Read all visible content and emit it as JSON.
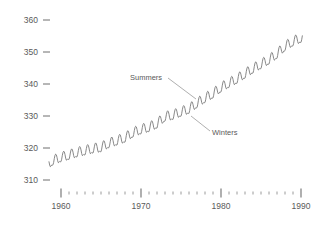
{
  "chart_data": {
    "type": "line",
    "title": "",
    "subtitle": "",
    "xlabel": "",
    "ylabel": "",
    "xlim": [
      1958.2,
      1990.4
    ],
    "ylim": [
      307.5,
      362
    ],
    "grid": false,
    "legend_position": "none",
    "x_ticks_major": [
      1960,
      1970,
      1980,
      1990
    ],
    "x_ticks_major_labels": [
      "1960",
      "1970",
      "1980",
      "1990"
    ],
    "x_ticks_minor": [
      1961,
      1962,
      1963,
      1964,
      1965,
      1966,
      1967,
      1968,
      1969,
      1971,
      1972,
      1973,
      1974,
      1975,
      1976,
      1977,
      1978,
      1979,
      1981,
      1982,
      1983,
      1984,
      1985,
      1986,
      1987,
      1988,
      1989
    ],
    "y_ticks": [
      310,
      320,
      330,
      340,
      350,
      360
    ],
    "y_tick_labels": [
      "310",
      "320",
      "330",
      "340",
      "350",
      "360"
    ],
    "line_color": "#7a7a7a",
    "text_color": "#5a5a5a",
    "axis_color": "#6e6e6e",
    "annotations": [
      {
        "label": "Summers",
        "text_x": 130,
        "text_y": 80,
        "leader_from_x": 168,
        "leader_from_y": 78,
        "leader_to_x": 196,
        "leader_to_y": 99
      },
      {
        "label": "Winters",
        "text_x": 212,
        "text_y": 135,
        "leader_from_x": 210,
        "leader_from_y": 131,
        "leader_to_x": 191,
        "leader_to_y": 116
      }
    ],
    "series": [
      {
        "name": "Atmospheric CO2 (ppm), Mauna Loa monthly mean",
        "annual_trend": [
          {
            "year": 1958.5,
            "value": 315.0
          },
          {
            "year": 1959,
            "value": 315.9
          },
          {
            "year": 1960,
            "value": 316.9
          },
          {
            "year": 1961,
            "value": 317.6
          },
          {
            "year": 1962,
            "value": 318.4
          },
          {
            "year": 1963,
            "value": 319.0
          },
          {
            "year": 1964,
            "value": 319.6
          },
          {
            "year": 1965,
            "value": 320.0
          },
          {
            "year": 1966,
            "value": 321.3
          },
          {
            "year": 1967,
            "value": 322.1
          },
          {
            "year": 1968,
            "value": 323.0
          },
          {
            "year": 1969,
            "value": 324.6
          },
          {
            "year": 1970,
            "value": 325.6
          },
          {
            "year": 1971,
            "value": 326.3
          },
          {
            "year": 1972,
            "value": 327.4
          },
          {
            "year": 1973,
            "value": 329.6
          },
          {
            "year": 1974,
            "value": 330.1
          },
          {
            "year": 1975,
            "value": 331.1
          },
          {
            "year": 1976,
            "value": 332.0
          },
          {
            "year": 1977,
            "value": 333.8
          },
          {
            "year": 1978,
            "value": 335.4
          },
          {
            "year": 1979,
            "value": 336.8
          },
          {
            "year": 1980,
            "value": 338.7
          },
          {
            "year": 1981,
            "value": 340.1
          },
          {
            "year": 1982,
            "value": 341.4
          },
          {
            "year": 1983,
            "value": 343.0
          },
          {
            "year": 1984,
            "value": 344.6
          },
          {
            "year": 1985,
            "value": 346.0
          },
          {
            "year": 1986,
            "value": 347.4
          },
          {
            "year": 1987,
            "value": 349.2
          },
          {
            "year": 1988,
            "value": 351.6
          },
          {
            "year": 1989,
            "value": 353.1
          },
          {
            "year": 1990.2,
            "value": 354.4
          }
        ],
        "seasonal_amplitude": 3.1,
        "seasonal_peak_month": 5,
        "description": "Monthly mean CO2 with a rising trend and a regular annual sawtooth: maxima in late spring (Summers label points to peaks), minima in autumn/winter (Winters label points to troughs)."
      }
    ]
  },
  "axis_geometry": {
    "x_pixel_1960": 61,
    "x_pixel_1990": 301,
    "y_pixel_310": 180,
    "y_pixel_360": 20,
    "axis_line_y": 193
  }
}
